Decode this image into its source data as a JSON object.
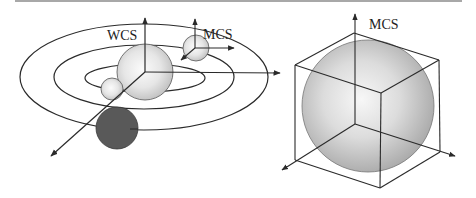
{
  "figure": {
    "left_panel": {
      "title": "Solar-system style scene with world and model coordinate systems",
      "wcs_label": "WCS",
      "mcs_label": "MCS",
      "orbits": 3,
      "spheres": [
        {
          "name": "central-sphere",
          "shade": "light"
        },
        {
          "name": "small-orbiting-sphere",
          "shade": "light"
        },
        {
          "name": "mcs-sphere",
          "shade": "light"
        },
        {
          "name": "dark-sphere",
          "shade": "dark"
        }
      ]
    },
    "right_panel": {
      "title": "Sphere inscribed in bounding cube with model coordinate system",
      "mcs_label": "MCS"
    },
    "colors": {
      "line": "#2a2a2a",
      "sphere_light": "#f4f4f4",
      "sphere_mid": "#c8c8c8",
      "sphere_dark": "#555555",
      "rule": "#a8a8a8"
    }
  }
}
